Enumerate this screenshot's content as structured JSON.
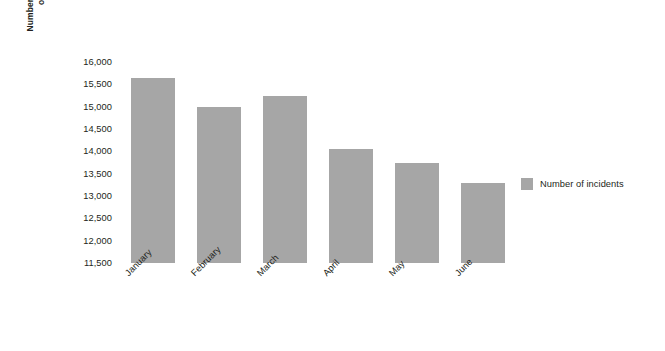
{
  "chart_data": {
    "type": "bar",
    "title": "",
    "subtitle": "",
    "xlabel": "",
    "ylabel": "Number of incidents\nopened",
    "categories": [
      "January",
      "February",
      "March",
      "April",
      "May",
      "June"
    ],
    "values": [
      15650,
      15000,
      15250,
      14050,
      13750,
      13300
    ],
    "series": [
      {
        "name": "Number of incidents",
        "values": [
          15650,
          15000,
          15250,
          14050,
          13750,
          13300
        ],
        "color": "#a6a6a6"
      }
    ],
    "ylim": [
      11500,
      16000
    ],
    "ytick_values": [
      16000,
      15500,
      15000,
      14500,
      14000,
      13500,
      13000,
      12500,
      12000,
      11500
    ],
    "ytick_labels": [
      "16,000",
      "15,500",
      "15,000",
      "14,500",
      "14,000",
      "13,500",
      "13,000",
      "12,500",
      "12,000",
      "11,500"
    ],
    "grid": false,
    "legend": {
      "position": "right",
      "entries": [
        {
          "label": "Number of incidents",
          "color": "#a6a6a6"
        }
      ]
    },
    "background_color": "#ffffff",
    "text_color": "#231f20",
    "xtick_rotation": -45
  }
}
